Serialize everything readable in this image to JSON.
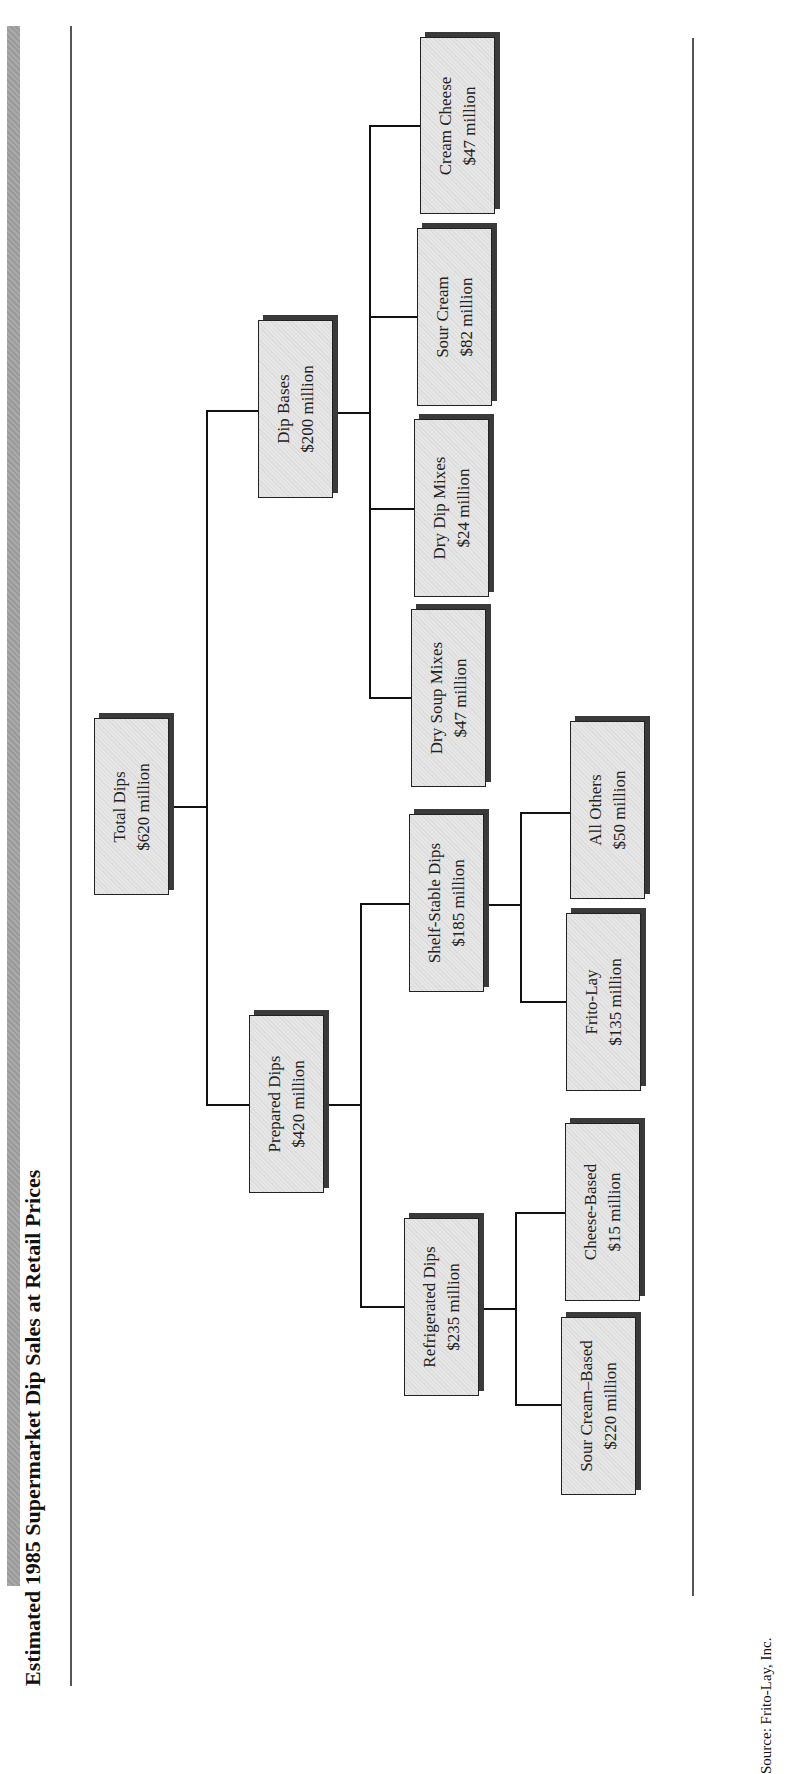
{
  "title": "Estimated 1985 Supermarket Dip Sales at Retail Prices",
  "source": "Source: Frito-Lay, Inc.",
  "colors": {
    "box_fill": "#e0e0e0",
    "box_shadow": "#3a3a3a",
    "lines": "#111111"
  },
  "tree": {
    "root": {
      "label": "Total Dips",
      "value": "$620 million"
    },
    "prepared": {
      "label": "Prepared Dips",
      "value": "$420 million"
    },
    "dip_bases": {
      "label": "Dip Bases",
      "value": "$200 million"
    },
    "refrigerated": {
      "label": "Refrigerated Dips",
      "value": "$235 million"
    },
    "shelf_stable": {
      "label": "Shelf-Stable Dips",
      "value": "$185 million"
    },
    "dry_soup": {
      "label": "Dry Soup Mixes",
      "value": "$47 million"
    },
    "dry_dip": {
      "label": "Dry Dip Mixes",
      "value": "$24 million"
    },
    "sour_cream": {
      "label": "Sour Cream",
      "value": "$82 million"
    },
    "cream_cheese": {
      "label": "Cream Cheese",
      "value": "$47 million"
    },
    "sour_cream_based": {
      "label": "Sour Cream–Based",
      "value": "$220 million"
    },
    "cheese_based": {
      "label": "Cheese-Based",
      "value": "$15 million"
    },
    "frito_lay": {
      "label": "Frito-Lay",
      "value": "$135 million"
    },
    "all_others": {
      "label": "All Others",
      "value": "$50 million"
    }
  }
}
